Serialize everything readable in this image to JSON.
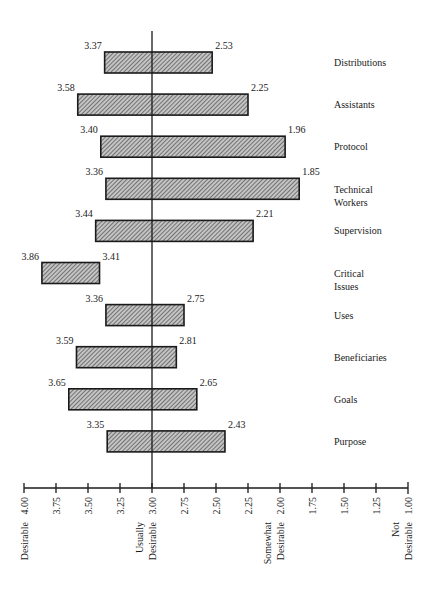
{
  "chart_data": {
    "type": "bar",
    "orientation": "horizontal-range",
    "title": "",
    "xlabel": "",
    "ylabel": "",
    "x_axis": {
      "reversed": true,
      "range": [
        4.0,
        1.0
      ],
      "ticks": [
        4.0,
        3.75,
        3.5,
        3.25,
        3.0,
        2.75,
        2.5,
        2.25,
        2.0,
        1.75,
        1.5,
        1.25,
        1.0
      ],
      "tick_labels": [
        "4.00",
        "3.75",
        "3.50",
        "3.25",
        "3.00",
        "2.75",
        "2.50",
        "2.25",
        "2.00",
        "1.75",
        "1.50",
        "1.25",
        "1.00"
      ],
      "anchor_labels": [
        {
          "value": 4.0,
          "lines": [
            "Desirable"
          ]
        },
        {
          "value": 3.0,
          "lines": [
            "Usually",
            "Desirable"
          ]
        },
        {
          "value": 2.0,
          "lines": [
            "Somewhat",
            "Desirable"
          ]
        },
        {
          "value": 1.0,
          "lines": [
            "Not",
            "Desirable"
          ]
        }
      ]
    },
    "reference_line": 3.0,
    "grid": false,
    "legend": "none",
    "categories": [
      {
        "label": [
          "Distributions"
        ],
        "high": 3.37,
        "low": 2.53,
        "high_label": "3.37",
        "low_label": "2.53"
      },
      {
        "label": [
          "Assistants"
        ],
        "high": 3.58,
        "low": 2.25,
        "high_label": "3.58",
        "low_label": "2.25"
      },
      {
        "label": [
          "Protocol"
        ],
        "high": 3.4,
        "low": 1.96,
        "high_label": "3.40",
        "low_label": "1.96"
      },
      {
        "label": [
          "Technical",
          "Workers"
        ],
        "high": 3.36,
        "low": 1.85,
        "high_label": "3.36",
        "low_label": "1.85"
      },
      {
        "label": [
          "Supervision"
        ],
        "high": 3.44,
        "low": 2.21,
        "high_label": "3.44",
        "low_label": "2.21"
      },
      {
        "label": [
          "Critical",
          "Issues"
        ],
        "high": 3.86,
        "low": 3.41,
        "high_label": "3.86",
        "low_label": "3.41"
      },
      {
        "label": [
          "Uses"
        ],
        "high": 3.36,
        "low": 2.75,
        "high_label": "3.36",
        "low_label": "2.75"
      },
      {
        "label": [
          "Beneficiaries"
        ],
        "high": 3.59,
        "low": 2.81,
        "high_label": "3.59",
        "low_label": "2.81"
      },
      {
        "label": [
          "Goals"
        ],
        "high": 3.65,
        "low": 2.65,
        "high_label": "3.65",
        "low_label": "2.65"
      },
      {
        "label": [
          "Purpose"
        ],
        "high": 3.35,
        "low": 2.43,
        "high_label": "3.35",
        "low_label": "2.43"
      }
    ],
    "colors": {
      "bar_fill": "#a8a8a8",
      "hatch": "#2a2a2a",
      "ink": "#1a1a1a"
    }
  }
}
